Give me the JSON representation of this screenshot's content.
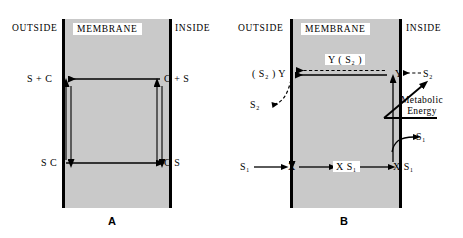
{
  "figure": {
    "title_a": "A",
    "title_b": "B"
  },
  "panel_a": {
    "name": "A",
    "headers": {
      "outside": "OUTSIDE",
      "membrane": "MEMBRANE",
      "inside": "INSIDE"
    },
    "labels": {
      "top_left": "S + C",
      "top_right": "C + S",
      "bottom_left": "S C",
      "bottom_right": "C S"
    },
    "arrows": [
      {
        "name": "top-arrow",
        "from": "C + S",
        "to": "S + C",
        "direction": "left",
        "style": "solid"
      },
      {
        "name": "bottom-arrow",
        "from": "S C",
        "to": "C S",
        "direction": "right",
        "style": "solid"
      },
      {
        "name": "left-up-arrow",
        "from": "S C",
        "to": "S + C",
        "direction": "up",
        "style": "solid"
      },
      {
        "name": "left-down-arrow",
        "from": "S + C",
        "to": "S C",
        "direction": "down",
        "style": "solid"
      },
      {
        "name": "right-up-arrow",
        "from": "C S",
        "to": "C + S",
        "direction": "up",
        "style": "solid"
      },
      {
        "name": "right-down-arrow",
        "from": "C + S",
        "to": "C S",
        "direction": "down",
        "style": "solid"
      }
    ]
  },
  "panel_b": {
    "name": "B",
    "headers": {
      "outside": "OUTSIDE",
      "membrane": "MEMBRANE",
      "inside": "INSIDE"
    },
    "labels": {
      "carrier_complex_top": "Y ( S₂ )",
      "left_carrier": "( S₂ ) Y",
      "right_carrier": "Y",
      "right_substrate_2": "S₂",
      "left_substrate_2": "S₂",
      "metabolic_energy": "Metabolic\nEnergy",
      "metabolic_energy_line1": "Metabolic",
      "metabolic_energy_line2": "Energy",
      "right_substrate_1": "S₁",
      "left_substrate_1": "S₁",
      "carrier_x": "X",
      "complex_mid": "X S₁",
      "complex_right": "X S₁"
    },
    "arrows": [
      {
        "name": "top-solid-arrow",
        "from": "Y",
        "to": "( S₂ ) Y",
        "direction": "left",
        "style": "solid"
      },
      {
        "name": "top-dashed-arrow",
        "from": "Y ( S₂ )",
        "to": "( S₂ ) Y",
        "direction": "left",
        "style": "dashed"
      },
      {
        "name": "s2-in-arrow",
        "from": "S₂",
        "to": "Y",
        "direction": "left",
        "style": "dashed"
      },
      {
        "name": "s2-out-arrow",
        "from": "( S₂ ) Y",
        "to": "S₂",
        "direction": "left",
        "style": "dashed-curved"
      },
      {
        "name": "y-to-x-arrow",
        "from": "( S₂ ) Y",
        "to": "X",
        "direction": "down",
        "style": "solid"
      },
      {
        "name": "x-to-y-arrow",
        "from": "X S₁",
        "to": "Y",
        "direction": "up",
        "style": "solid"
      },
      {
        "name": "metabolic-energy-arrow",
        "direction": "up-right",
        "style": "solid"
      },
      {
        "name": "s1-in-arrow",
        "from": "S₁",
        "to": "X",
        "direction": "right",
        "style": "solid"
      },
      {
        "name": "x-to-xs1-arrow",
        "from": "X",
        "to": "X S₁",
        "direction": "right",
        "style": "solid"
      },
      {
        "name": "xs1-to-xs1-arrow",
        "from": "X S₁",
        "to": "X S₁",
        "direction": "right",
        "style": "solid"
      },
      {
        "name": "s1-out-arrow",
        "to": "S₁",
        "direction": "right",
        "style": "solid-curved"
      }
    ]
  },
  "colors": {
    "membrane_fill": "#c9c9c9",
    "stroke": "#000000",
    "background": "#ffffff"
  }
}
